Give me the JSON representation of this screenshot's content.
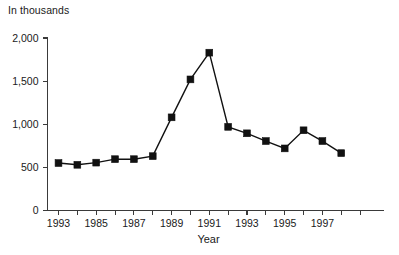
{
  "chart_data": {
    "type": "line",
    "title": "",
    "unit_note": "In thousands",
    "xlabel": "Year",
    "ylabel": "",
    "categories": [
      "1993",
      "1984",
      "1985",
      "1986",
      "1987",
      "1988",
      "1989",
      "1990",
      "1991",
      "1992",
      "1993",
      "1994",
      "1995",
      "1996",
      "1997",
      "1998"
    ],
    "x_tick_labels": [
      "1993",
      "",
      "1985",
      "",
      "1987",
      "",
      "1989",
      "",
      "1991",
      "",
      "1993",
      "",
      "1995",
      "",
      "1997",
      ""
    ],
    "values": [
      550,
      530,
      555,
      595,
      595,
      630,
      1080,
      1520,
      1830,
      970,
      895,
      805,
      720,
      930,
      805,
      665
    ],
    "y_tick_labels": [
      "0",
      "500",
      "1,000",
      "1,500",
      "2,000"
    ],
    "y_tick_values": [
      0,
      500,
      1000,
      1500,
      2000
    ],
    "ylim": [
      0,
      2000
    ],
    "xlim": [
      0,
      17
    ],
    "grid": false,
    "legend": "none",
    "marker": "square",
    "series_color": "#111111",
    "axis_color": "#3a3a3a",
    "background": "#ffffff"
  },
  "figure": {
    "unit_note": "In thousands",
    "xaxis_title": "Year"
  }
}
